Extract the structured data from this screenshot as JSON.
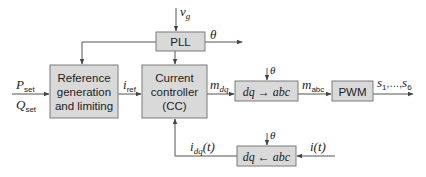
{
  "diagram": {
    "type": "block-diagram",
    "blocks": {
      "pll": {
        "label": "PLL"
      },
      "reference": {
        "lines": [
          "Reference",
          "generation",
          "and limiting"
        ]
      },
      "current_controller": {
        "lines": [
          "Current",
          "controller",
          "(CC)"
        ]
      },
      "dq_to_abc": {
        "label": "dq → abc"
      },
      "pwm": {
        "label": "PWM"
      },
      "abc_to_dq": {
        "label": "dq ← abc"
      }
    },
    "signals": {
      "vg": {
        "main": "v",
        "sub": "g"
      },
      "theta_pll": "θ",
      "theta_dq_abc": "θ",
      "theta_abc_dq": "θ",
      "p_set": {
        "main": "P",
        "sub": "set"
      },
      "q_set": {
        "main": "Q",
        "sub": "set"
      },
      "i_ref": {
        "main": "i",
        "sub": "ref"
      },
      "m_dq": {
        "main": "m",
        "sub": "dq"
      },
      "m_abc": {
        "main": "m",
        "sub": "abc"
      },
      "switches": {
        "s1": "s",
        "s1_sub": "1",
        "dots": ",…,",
        "s6": "s",
        "s6_sub": "6"
      },
      "i_dq_t": {
        "main": "i",
        "sub": "dq",
        "arg": "(t)"
      },
      "i_t": "i(t)"
    },
    "colors": {
      "block_fill": "#d9d9d9",
      "block_border": "#7a7a7a",
      "wire": "#555555",
      "text": "#222222"
    }
  }
}
